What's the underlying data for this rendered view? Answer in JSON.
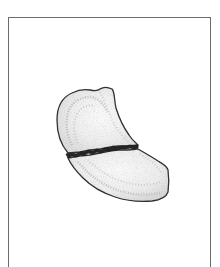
{
  "figure": {
    "colors": {
      "frame": "#6b6b6b",
      "outline": "#2e2e2e",
      "fracture_line": "#1f1f1f",
      "fill_light": "#f2f2f2",
      "fill_shade": "#c9c9c9",
      "background": "#ffffff"
    },
    "parts": [
      {
        "name": "upper-fragment"
      },
      {
        "name": "fracture-line"
      },
      {
        "name": "lower-fragment"
      }
    ]
  }
}
